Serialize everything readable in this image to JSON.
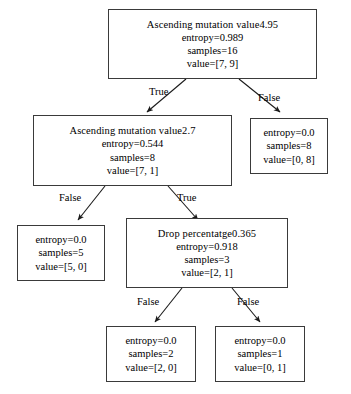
{
  "diagram": {
    "background_color": "#ffffff",
    "node_border_color": "#3a3a3a",
    "text_color": "#000000",
    "edge_color": "#1a1a1a"
  },
  "nodes": {
    "root": {
      "id": "root",
      "type": "internal",
      "condition": "Ascending mutation value⁤4.95",
      "entropy": "entropy=0.989",
      "samples": "samples=16",
      "value": "value=[7, 9]"
    },
    "n_left": {
      "id": "n_left",
      "type": "internal",
      "condition": "Ascending mutation value⁤2.7",
      "entropy": "entropy=0.544",
      "samples": "samples=8",
      "value": "value=[7, 1]"
    },
    "n_right": {
      "id": "n_right",
      "type": "leaf",
      "entropy": "entropy=0.0",
      "samples": "samples=8",
      "value": "value=[0, 8]"
    },
    "n_left_left": {
      "id": "n_left_left",
      "type": "leaf",
      "entropy": "entropy=0.0",
      "samples": "samples=5",
      "value": "value=[5, 0]"
    },
    "n_left_right": {
      "id": "n_left_right",
      "type": "internal",
      "condition": "Drop percentatge⁤0.365",
      "entropy": "entropy=0.918",
      "samples": "samples=3",
      "value": "value=[2, 1]"
    },
    "n_leaf_a": {
      "id": "n_leaf_a",
      "type": "leaf",
      "entropy": "entropy=0.0",
      "samples": "samples=2",
      "value": "value=[2, 0]"
    },
    "n_leaf_b": {
      "id": "n_leaf_b",
      "type": "leaf",
      "entropy": "entropy=0.0",
      "samples": "samples=1",
      "value": "value=[0, 1]"
    }
  },
  "edges": {
    "root_left": "True",
    "root_right": "False",
    "left_left": "False",
    "left_right": "True",
    "drop_left": "False",
    "drop_right": "False"
  }
}
